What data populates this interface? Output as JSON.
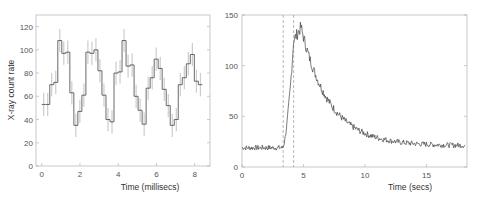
{
  "chart_data": [
    {
      "type": "line",
      "style": "step-with-error-bars",
      "title": "",
      "xlabel": "Time (millisecs)",
      "ylabel": "X-ray count rate",
      "xlim": [
        -0.3,
        8.8
      ],
      "ylim": [
        0,
        130
      ],
      "xticks": [
        0,
        2,
        4,
        6,
        8
      ],
      "yticks": [
        0,
        20,
        40,
        60,
        80,
        100,
        120
      ],
      "grid": false,
      "bin_width": 0.21,
      "x_start": 0,
      "values": [
        53,
        53,
        70,
        72,
        108,
        97,
        98,
        63,
        35,
        47,
        61,
        98,
        97,
        100,
        82,
        61,
        40,
        38,
        80,
        81,
        108,
        86,
        87,
        60,
        48,
        36,
        67,
        76,
        92,
        84,
        66,
        52,
        35,
        40,
        70,
        76,
        88,
        96,
        73,
        70
      ],
      "error": 10
    },
    {
      "type": "line",
      "title": "",
      "xlabel": "Time (secs)",
      "ylabel": "",
      "xlim": [
        0,
        18.3
      ],
      "ylim": [
        0,
        150
      ],
      "xticks": [
        0,
        5,
        10,
        15
      ],
      "yticks": [
        0,
        50,
        100,
        150
      ],
      "grid": false,
      "vertical_markers": [
        3.35,
        4.2
      ],
      "model": {
        "baseline": 19,
        "rise_start": 3.3,
        "rise_end": 4.2,
        "rise_value": 125,
        "peak_time": 4.8,
        "peak_value": 138,
        "decay_floor": 21,
        "decay_tau": 2.3
      },
      "series_samples": [
        [
          0,
          18
        ],
        [
          1,
          19
        ],
        [
          2,
          18
        ],
        [
          3,
          19
        ],
        [
          3.3,
          21
        ],
        [
          3.6,
          45
        ],
        [
          3.9,
          95
        ],
        [
          4.2,
          124
        ],
        [
          4.5,
          128
        ],
        [
          4.8,
          138
        ],
        [
          5.2,
          128
        ],
        [
          5.7,
          115
        ],
        [
          6.2,
          100
        ],
        [
          6.7,
          80
        ],
        [
          7.2,
          68
        ],
        [
          8,
          52
        ],
        [
          9,
          40
        ],
        [
          10,
          33
        ],
        [
          11,
          29
        ],
        [
          12,
          27
        ],
        [
          13,
          25
        ],
        [
          14,
          23
        ],
        [
          15,
          23
        ],
        [
          16,
          22
        ],
        [
          17,
          22
        ],
        [
          18,
          21
        ]
      ]
    }
  ]
}
